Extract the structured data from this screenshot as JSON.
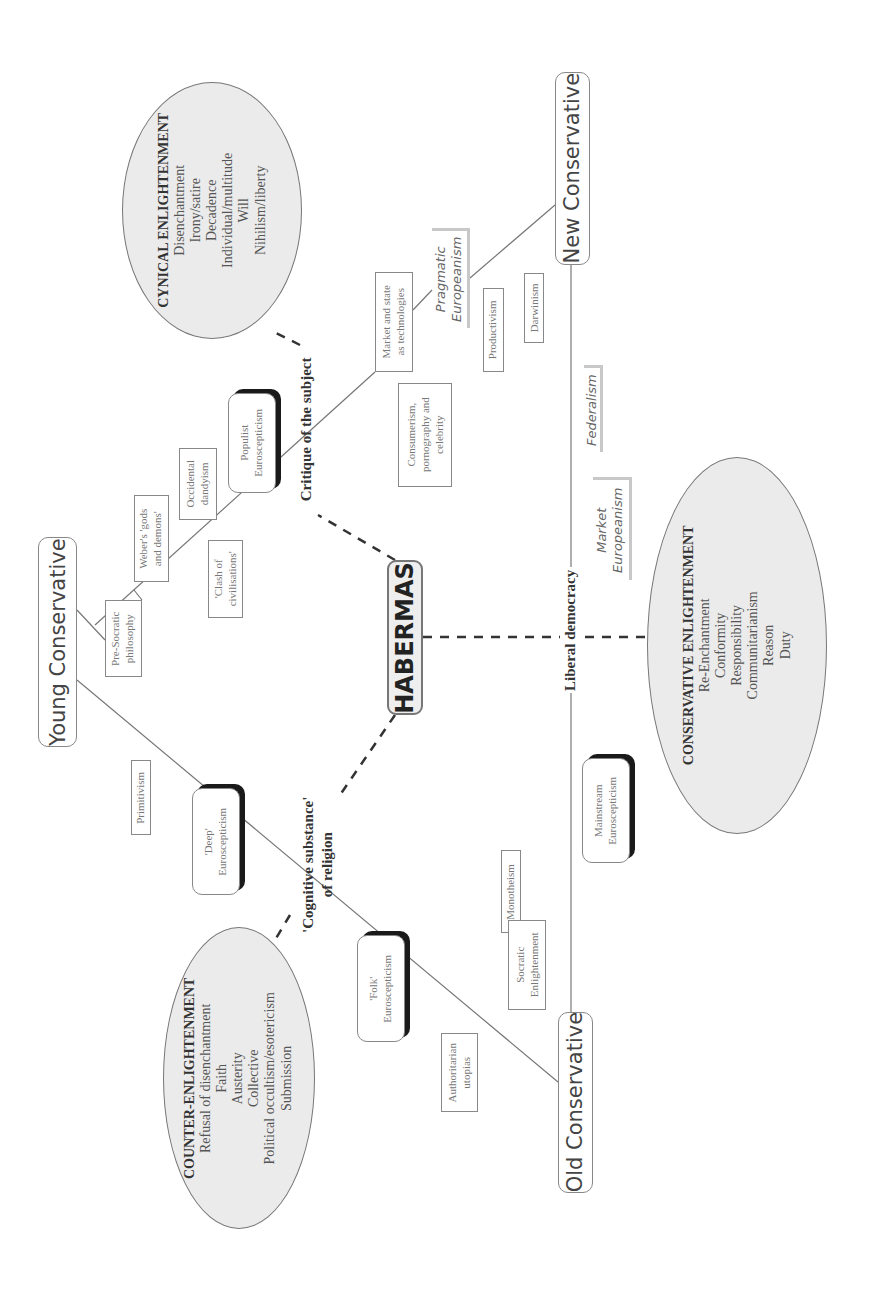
{
  "center": {
    "label": "HABERMAS"
  },
  "poles": {
    "young": "Young Conservative",
    "new": "New Conservative",
    "old": "Old Conservative"
  },
  "axes": {
    "critique": "Critique of the subject",
    "cognitive": "'Cognitive substance' of religion",
    "cognitive_line1": "'Cognitive substance'",
    "cognitive_line2": "of religion",
    "liberal": "Liberal democracy"
  },
  "ellipses": {
    "cynical": {
      "title": "CYNICAL ENLIGHTENMENT",
      "items": [
        "Disenchantment",
        "Irony/satire",
        "Decadence",
        "Individual/multitude",
        "Will",
        "Nihilism/liberty"
      ]
    },
    "counter": {
      "title": "COUNTER-ENLIGHTENMENT",
      "items": [
        "Refusal of disenchantment",
        "Faith",
        "Austerity",
        "Collective",
        "Political occultism/esotericism",
        "Submission"
      ]
    },
    "conservative": {
      "title": "CONSERVATIVE ENLIGHTENMENT",
      "items": [
        "Re-Enchantment",
        "Conformity",
        "Responsibility",
        "Communitarianism",
        "Reason",
        "Duty"
      ]
    }
  },
  "boxes": {
    "pre_socratic": [
      "Pre-Socratic",
      "philosophy"
    ],
    "weber": [
      "Weber's 'gods",
      "and demons'"
    ],
    "occidental": [
      "Occidental",
      "dandyism"
    ],
    "clash": [
      "'Clash of",
      "civilisations'"
    ],
    "consumerism": [
      "Consumerism,",
      "pornography and",
      "celebrity"
    ],
    "market_state": [
      "Market and state",
      "as technologies"
    ],
    "productivism": [
      "Productivism"
    ],
    "darwinism": [
      "Darwinism"
    ],
    "primitivism": [
      "Primitivism"
    ],
    "monotheism": [
      "Monotheism"
    ],
    "socratic": [
      "Socratic",
      "Enlightenment"
    ],
    "authoritarian": [
      "Authoritarian",
      "utopias"
    ]
  },
  "euroscepticisms": {
    "populist": [
      "Populist",
      "Euroscepticism"
    ],
    "deep": [
      "'Deep'",
      "Euroscepticism"
    ],
    "folk": [
      "'Folk'",
      "Euroscepticism"
    ],
    "mainstream": [
      "Mainstream",
      "Euroscepticism"
    ]
  },
  "europeanisms": {
    "pragmatic": [
      "Pragmatic",
      "Europeanism"
    ],
    "federalism": [
      "Federalism"
    ],
    "market": [
      "Market",
      "Europeanism"
    ]
  }
}
